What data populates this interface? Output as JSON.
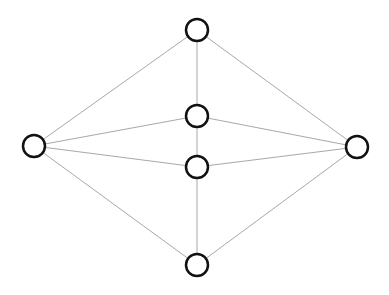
{
  "diagram": {
    "type": "undirected-graph",
    "width": 389,
    "height": 295,
    "colors": {
      "background": "#ffffff",
      "edge": "#a8a8a8",
      "node_stroke": "#111111",
      "node_fill": "#ffffff"
    },
    "node_radius": 11,
    "nodes": [
      {
        "id": "top",
        "x": 197,
        "y": 30
      },
      {
        "id": "mid-upper",
        "x": 197,
        "y": 116
      },
      {
        "id": "mid-lower",
        "x": 197,
        "y": 167
      },
      {
        "id": "bottom",
        "x": 197,
        "y": 265
      },
      {
        "id": "left",
        "x": 34,
        "y": 146
      },
      {
        "id": "right",
        "x": 357,
        "y": 147
      }
    ],
    "edges": [
      [
        "top",
        "left"
      ],
      [
        "top",
        "right"
      ],
      [
        "top",
        "mid-upper"
      ],
      [
        "mid-upper",
        "left"
      ],
      [
        "mid-upper",
        "right"
      ],
      [
        "mid-upper",
        "mid-lower"
      ],
      [
        "mid-lower",
        "left"
      ],
      [
        "mid-lower",
        "right"
      ],
      [
        "mid-lower",
        "bottom"
      ],
      [
        "bottom",
        "left"
      ],
      [
        "bottom",
        "right"
      ]
    ]
  }
}
